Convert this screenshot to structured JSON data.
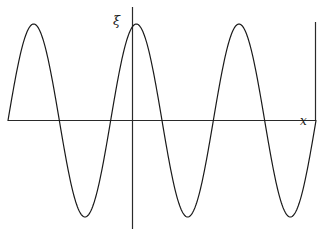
{
  "chart_data": {
    "type": "line",
    "title": "",
    "subtitle": "",
    "xlabel": "x",
    "ylabel": "ξ",
    "grid": false,
    "legend": null,
    "annotations": [],
    "axis_style": {
      "x_axis": "horizontal line spanning full plot width at y = 0",
      "y_axis": "vertical line at x = 0 extending above and below the x-axis",
      "ticks": "none",
      "tick_labels": "none",
      "right_edge": "vertical drop line from curve end down to x-axis right end"
    },
    "xlim": [
      -1.42,
      1.58
    ],
    "ylim": [
      -1.25,
      1.3
    ],
    "series": [
      {
        "name": "ξ(x)",
        "color": "#1a1a1a",
        "line_width": 1,
        "function": "sin(2*pi*x)",
        "x": [
          -1.42,
          -1.3,
          -1.17,
          -1.05,
          -0.92,
          -0.8,
          -0.67,
          -0.55,
          -0.42,
          -0.3,
          -0.17,
          -0.05,
          0.08,
          0.2,
          0.33,
          0.45,
          0.58,
          0.7,
          0.83,
          0.95,
          1.08,
          1.2,
          1.33,
          1.45,
          1.58
        ],
        "y": [
          0.0,
          -0.66,
          -0.97,
          -0.95,
          -0.62,
          -0.1,
          0.45,
          0.84,
          1.0,
          0.88,
          0.51,
          -0.02,
          -0.54,
          -0.87,
          -1.0,
          -0.84,
          -0.47,
          0.06,
          0.57,
          0.88,
          1.0,
          0.85,
          0.48,
          0.05,
          1.0
        ]
      }
    ],
    "key_points": {
      "start": {
        "x": -1.42,
        "y": 0.0
      },
      "trough_1": {
        "x": -1.12,
        "y": -1.0
      },
      "zero_crossing_up_1": {
        "x": -0.73,
        "y": 0.0
      },
      "crest_1": {
        "x": -0.39,
        "y": 1.0
      },
      "zero_crossing_down_1": {
        "x": -0.06,
        "y": 0.0
      },
      "trough_2": {
        "x": 0.36,
        "y": -1.0
      },
      "zero_crossing_up_2": {
        "x": 0.75,
        "y": 0.0
      },
      "crest_2": {
        "x": 1.32,
        "y": 1.0
      },
      "end": {
        "x": 1.58,
        "y": 1.0
      }
    }
  },
  "figure": {
    "background_color": "#ffffff",
    "line_color": "#1a1a1a",
    "axis_color": "#2a2a2a"
  }
}
